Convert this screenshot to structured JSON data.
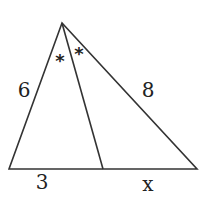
{
  "diagram": {
    "type": "triangle-angle-bisector",
    "stroke_color": "#333333",
    "background": "#ffffff",
    "vertices": {
      "apex": [
        62,
        23
      ],
      "bottom_left": [
        9,
        169
      ],
      "bottom_right": [
        197,
        169
      ],
      "bisector_foot": [
        103,
        169
      ]
    },
    "labels": {
      "left_side": "6",
      "right_side": "8",
      "base_left_segment": "3",
      "base_right_segment": "x"
    },
    "angle_marks": {
      "left": "*",
      "right": "*"
    }
  }
}
